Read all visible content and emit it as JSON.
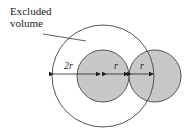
{
  "diagram": {
    "label": {
      "line1": "Excluded",
      "line2": "volume"
    },
    "dimensions": {
      "outer_gap": "2r",
      "inner_left": "r",
      "inner_right": "r"
    },
    "colors": {
      "shaded": "#c8c8c8",
      "stroke": "#555555",
      "background": "#ffffff"
    }
  }
}
